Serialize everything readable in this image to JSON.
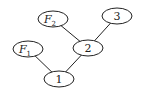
{
  "diagram": {
    "type": "tree",
    "nodes": [
      {
        "id": "n1",
        "label": "1",
        "sub": "",
        "italic": false,
        "cx": 59,
        "cy": 79
      },
      {
        "id": "n2",
        "label": "2",
        "sub": "",
        "italic": false,
        "cx": 88,
        "cy": 48
      },
      {
        "id": "n3",
        "label": "3",
        "sub": "",
        "italic": false,
        "cx": 117,
        "cy": 16
      },
      {
        "id": "F1",
        "label": "F",
        "sub": "1",
        "italic": true,
        "cx": 28,
        "cy": 49
      },
      {
        "id": "F2",
        "label": "F",
        "sub": "2",
        "italic": true,
        "cx": 53,
        "cy": 19
      }
    ],
    "edges": [
      {
        "from": "F2",
        "to": "n2"
      },
      {
        "from": "n3",
        "to": "n2"
      },
      {
        "from": "F1",
        "to": "n1"
      },
      {
        "from": "n2",
        "to": "n1"
      }
    ],
    "node_shape": "ellipse",
    "rx": 15,
    "ry": 8,
    "colors": {
      "stroke": "#222222",
      "fill": "#ffffff",
      "background": "#ffffff"
    }
  }
}
